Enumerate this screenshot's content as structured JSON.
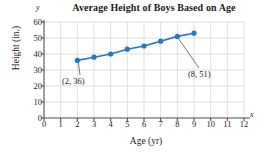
{
  "chart_data": {
    "type": "scatter",
    "title": "Average Height of Boys Based on Age",
    "xlabel": "Age (yr)",
    "ylabel": "Height (in.)",
    "x_axis_symbol": "x",
    "y_axis_symbol": "y",
    "xlim": [
      0,
      12
    ],
    "ylim": [
      0,
      60
    ],
    "xticks": [
      0,
      1,
      2,
      3,
      4,
      5,
      6,
      7,
      8,
      9,
      10,
      11,
      12
    ],
    "yticks": [
      0,
      10,
      20,
      30,
      40,
      50,
      60
    ],
    "xtick_labels": [
      "0",
      "1",
      "2",
      "3",
      "4",
      "5",
      "6",
      "7",
      "8",
      "9",
      "10",
      "11",
      "12"
    ],
    "ytick_labels": [
      "0",
      "10",
      "20",
      "30",
      "40",
      "50",
      "60"
    ],
    "grid": true,
    "legend": null,
    "x": [
      2,
      3,
      4,
      5,
      6,
      7,
      8,
      9
    ],
    "values": [
      36,
      38,
      40,
      43,
      45,
      48,
      51,
      53
    ],
    "series": [
      {
        "name": "Average height",
        "x": [
          2,
          3,
          4,
          5,
          6,
          7,
          8,
          9
        ],
        "values": [
          36,
          38,
          40,
          43,
          45,
          48,
          51,
          53
        ],
        "color": "#2878be",
        "marker": "circle",
        "line": true
      }
    ],
    "annotations": [
      {
        "label": "(2, 36)",
        "point_x": 2,
        "point_y": 36
      },
      {
        "label": "(8, 51)",
        "point_x": 8,
        "point_y": 51
      }
    ],
    "colors": {
      "series": "#2878be",
      "grid": "#d8d8d8",
      "axis": "#4d4d4d",
      "text": "#1a1a1a",
      "background": "#ffffff"
    }
  }
}
